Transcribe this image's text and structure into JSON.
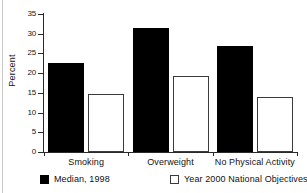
{
  "chart_data": {
    "type": "bar",
    "title": "",
    "xlabel": "",
    "ylabel": "Percent",
    "ylim": [
      0,
      35
    ],
    "yticks": [
      0,
      5,
      10,
      15,
      20,
      25,
      30,
      35
    ],
    "ytick_labels": [
      "0",
      "5",
      "10",
      "15",
      "20",
      "25",
      "30",
      "35"
    ],
    "grid": false,
    "legend_position": "bottom",
    "categories": [
      "Smoking",
      "Overweight",
      "No Physical Activity"
    ],
    "series": [
      {
        "name": "Median, 1998",
        "style": "filled",
        "color": "#000000",
        "values": [
          22.7,
          31.5,
          27.0
        ]
      },
      {
        "name": "Year 2000 National Objectives",
        "style": "hollow",
        "color": "#ffffff",
        "edge_color": "#3b3b3b",
        "values": [
          14.7,
          19.3,
          13.9
        ]
      }
    ]
  },
  "axis": {
    "y_title": "Percent"
  },
  "legend": {
    "items": [
      {
        "label": "Median, 1998"
      },
      {
        "label": "Year 2000 National Objectives"
      }
    ]
  },
  "colors": {
    "ink": "#111111",
    "axis": "#2a2a2a",
    "series_filled": "#000000",
    "series_hollow_edge": "#3b3b3b",
    "background": "#ffffff"
  }
}
